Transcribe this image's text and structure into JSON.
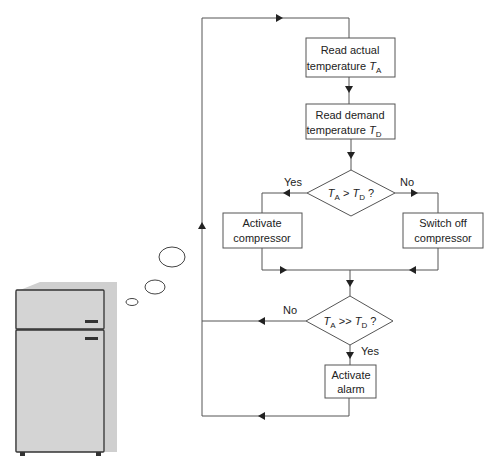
{
  "flowchart": {
    "nodes": {
      "read_actual": {
        "line1": "Read actual",
        "line2": "temperature",
        "var": "T",
        "sub": "A"
      },
      "read_demand": {
        "line1": "Read demand",
        "line2": "temperature",
        "var": "T",
        "sub": "D"
      },
      "decision1": {
        "left_var": "T",
        "left_sub": "A",
        "op": ">",
        "right_var": "T",
        "right_sub": "D",
        "q": "?"
      },
      "activate_compressor": {
        "line1": "Activate",
        "line2": "compressor"
      },
      "switch_off_compressor": {
        "line1": "Switch off",
        "line2": "compressor"
      },
      "decision2": {
        "left_var": "T",
        "left_sub": "A",
        "op": ">>",
        "right_var": "T",
        "right_sub": "D",
        "q": "?"
      },
      "activate_alarm": {
        "line1": "Activate",
        "line2": "alarm"
      }
    },
    "edge_labels": {
      "d1_yes": "Yes",
      "d1_no": "No",
      "d2_no": "No",
      "d2_yes": "Yes"
    }
  },
  "illustration": {
    "subject": "refrigerator",
    "thought_bubbles": 3
  }
}
